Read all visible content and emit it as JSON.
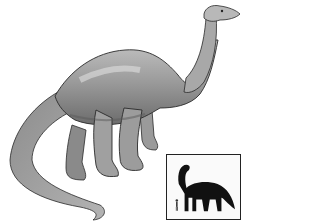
{
  "image": {
    "subject": "sauropod dinosaur illustration",
    "style": "grayscale pencil drawing",
    "colors": {
      "background": "#ffffff",
      "body_light": "#b8b8b8",
      "body_mid": "#8a8a8a",
      "body_dark": "#4a4a4a",
      "outline": "#2a2a2a",
      "silhouette": "#111111",
      "inset_border": "#222222"
    }
  },
  "inset": {
    "description": "size comparison: dinosaur silhouette next to human figure"
  }
}
